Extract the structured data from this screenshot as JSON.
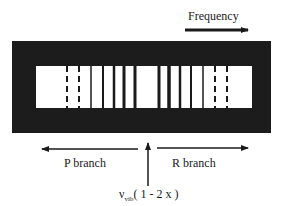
{
  "labels": {
    "frequency": "Frequency",
    "p_branch": "P branch",
    "r_branch": "R branch",
    "center_nu": "ν",
    "center_sub": "vib",
    "center_rest": "( 1 - 2 x )"
  },
  "colors": {
    "frame": "#1c1c1c",
    "window": "#ffffff",
    "line": "#1a1a1a"
  },
  "frame": {
    "x": 12,
    "y": 41,
    "w": 259,
    "h": 92
  },
  "window": {
    "x": 36,
    "y": 66,
    "w": 216,
    "h": 42
  },
  "spectral_lines": [
    {
      "x": 67,
      "style": "dashed",
      "width": 2
    },
    {
      "x": 79,
      "style": "dashed",
      "width": 2
    },
    {
      "x": 91,
      "style": "solid",
      "width": 1.5
    },
    {
      "x": 103,
      "style": "solid",
      "width": 2
    },
    {
      "x": 114,
      "style": "solid",
      "width": 2.5
    },
    {
      "x": 124,
      "style": "solid",
      "width": 3
    },
    {
      "x": 135,
      "style": "solid",
      "width": 3
    },
    {
      "x": 159,
      "style": "solid",
      "width": 3
    },
    {
      "x": 169,
      "style": "solid",
      "width": 3.5
    },
    {
      "x": 180,
      "style": "solid",
      "width": 2.5
    },
    {
      "x": 191,
      "style": "solid",
      "width": 2
    },
    {
      "x": 203,
      "style": "solid",
      "width": 1.5
    },
    {
      "x": 215,
      "style": "dashed",
      "width": 2
    },
    {
      "x": 227,
      "style": "dashed",
      "width": 2
    }
  ],
  "arrows": {
    "frequency": {
      "x1": 185,
      "y1": 30,
      "x2": 248,
      "y2": 30
    },
    "p_branch": {
      "x1": 138,
      "y1": 149,
      "x2": 42,
      "y2": 149
    },
    "r_branch": {
      "x1": 157,
      "y1": 148,
      "x2": 248,
      "y2": 148
    },
    "center": {
      "x1": 148,
      "y1": 186,
      "x2": 148,
      "y2": 143
    }
  }
}
